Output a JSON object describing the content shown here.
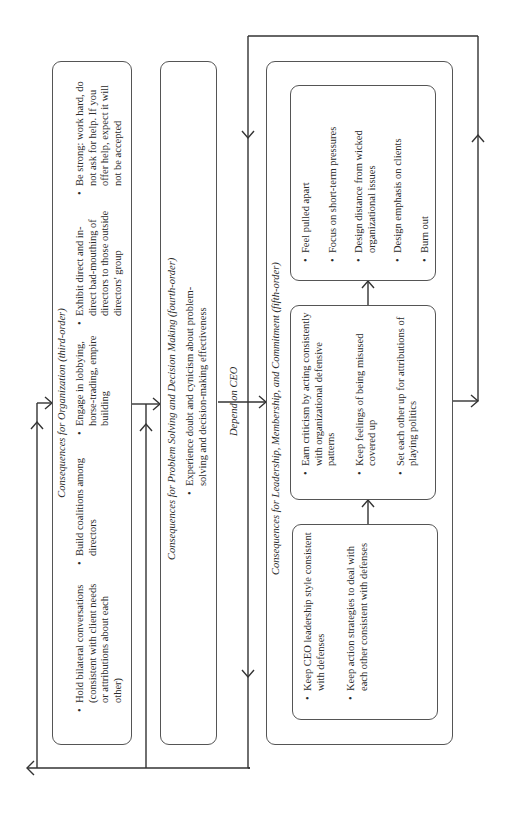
{
  "diagram": {
    "orientation": "rotated-90-ccw",
    "third_order": {
      "title": "Consequences for Organization (third-order)",
      "col1": [
        "Hold bilateral conversations (consistent with client needs or attributions about each other)"
      ],
      "col2": [
        "Build coalitions among directors"
      ],
      "col3": [
        "Engage in lobbying, horse-trading, empire building"
      ],
      "col4": [
        "Exhibit direct and in-direct bad-mouthing of directors to those outside directors' group"
      ],
      "col5": [
        "Be strong: work hard, do not ask for help. If you offer help, expect it will not be accepted"
      ]
    },
    "fourth_order": {
      "title": "Consequences for Problem Solving and Decision Making (fourth-order)",
      "items": [
        "Experience doubt and cynicism about problem-solving and decision-making effectiveness"
      ]
    },
    "connector_label": "Depend on CEO",
    "fifth_order": {
      "title": "Consequences for Leadership, Membership, and Commitment (fifth-order)",
      "box_a": [
        "Keep CEO leadership style consistent with defenses",
        "Keep action strategies to deal with each other consistent with defenses"
      ],
      "box_b": [
        "Earn criticism by acting consistently with organizational defensive patterns",
        "Keep feelings of being misused covered up",
        "Set each other up for attributions of playing politics"
      ],
      "box_c": [
        "Feel pulled apart",
        "Focus on short-term pressures",
        "Design distance from wicked organizational issues",
        "Design emphasis on clients",
        "Burn out"
      ]
    },
    "colors": {
      "line": "#333333",
      "box_border": "#555555",
      "text": "#2a2a2a"
    }
  }
}
